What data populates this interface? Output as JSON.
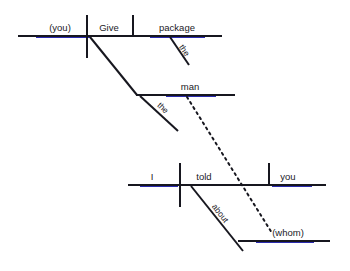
{
  "diagram": {
    "type": "sentence-diagram",
    "sentence": "(You) give the man the package (whom) I told you about.",
    "canvas": {
      "width": 350,
      "height": 271,
      "background": "#ffffff"
    },
    "colors": {
      "line": "#17171f",
      "text": "#1a1a26",
      "underline_tint": "#2b2bb0"
    },
    "clauses": [
      {
        "name": "main-clause",
        "baseline": {
          "x1": 18,
          "y1": 36,
          "x2": 222,
          "y2": 36
        },
        "words": [
          {
            "id": "subject",
            "text": "(you)",
            "x": 60,
            "y": 31,
            "anchor": "middle",
            "role": "subject",
            "implied": true
          },
          {
            "id": "verb",
            "text": "Give",
            "x": 109,
            "y": 31,
            "anchor": "middle",
            "role": "verb"
          },
          {
            "id": "direct-object",
            "text": "package",
            "x": 177,
            "y": 31,
            "anchor": "middle",
            "role": "direct-object"
          },
          {
            "id": "article-package",
            "text": "the",
            "x": 0,
            "y": 0,
            "anchor": "middle",
            "role": "article",
            "rotated": true
          }
        ],
        "dividers": [
          {
            "id": "subject-verb-divider",
            "x1": 87,
            "y1": 15,
            "x2": 87,
            "y2": 58
          },
          {
            "id": "verb-object-divider",
            "x1": 133,
            "y1": 15,
            "x2": 133,
            "y2": 36
          }
        ],
        "modifier_slants": [
          {
            "id": "the-package-slant",
            "x1": 170,
            "y1": 37,
            "x2": 189,
            "y2": 65,
            "label": "the"
          }
        ]
      },
      {
        "name": "indirect-object-branch",
        "baseline": {
          "x1": 137,
          "y1": 95,
          "x2": 235,
          "y2": 95
        },
        "words": [
          {
            "id": "indirect-object",
            "text": "man",
            "x": 190,
            "y": 90,
            "anchor": "middle",
            "role": "indirect-object"
          },
          {
            "id": "article-man",
            "text": "the",
            "x": 0,
            "y": 0,
            "anchor": "middle",
            "role": "article",
            "rotated": true
          }
        ],
        "connector_slant": {
          "id": "give-to-man-slant",
          "x1": 90,
          "y1": 37,
          "x2": 137,
          "y2": 95
        },
        "modifier_slants": [
          {
            "id": "the-man-slant",
            "x1": 140,
            "y1": 96,
            "x2": 178,
            "y2": 131,
            "label": "the"
          }
        ]
      },
      {
        "name": "relative-clause",
        "baseline": {
          "x1": 128,
          "y1": 185,
          "x2": 326,
          "y2": 185
        },
        "words": [
          {
            "id": "rel-subject",
            "text": "I",
            "x": 152,
            "y": 180,
            "anchor": "middle",
            "role": "subject"
          },
          {
            "id": "rel-verb",
            "text": "told",
            "x": 204,
            "y": 180,
            "anchor": "middle",
            "role": "verb"
          },
          {
            "id": "rel-object",
            "text": "you",
            "x": 288,
            "y": 180,
            "anchor": "middle",
            "role": "direct-object"
          }
        ],
        "dividers": [
          {
            "id": "rel-subject-verb-divider",
            "x1": 180,
            "y1": 163,
            "x2": 180,
            "y2": 207
          },
          {
            "id": "rel-verb-object-divider",
            "x1": 269,
            "y1": 163,
            "x2": 269,
            "y2": 185
          }
        ],
        "modifier_slants": [
          {
            "id": "about-slant",
            "x1": 191,
            "y1": 186,
            "x2": 243,
            "y2": 251,
            "label": "about"
          }
        ]
      },
      {
        "name": "prepositional-object",
        "baseline": {
          "x1": 240,
          "y1": 241,
          "x2": 330,
          "y2": 241
        },
        "words": [
          {
            "id": "prep-object",
            "text": "(whom)",
            "x": 288,
            "y": 236,
            "anchor": "middle",
            "role": "object-of-preposition",
            "implied": true
          }
        ]
      }
    ],
    "reference_line": {
      "id": "relative-pronoun-reference",
      "style": "dotted",
      "from": {
        "x": 187,
        "y": 97
      },
      "to": {
        "x": 272,
        "y": 233
      },
      "connects": [
        "man",
        "(whom)"
      ]
    },
    "rotated_labels": [
      {
        "id": "the-package-label",
        "text": "the",
        "x": 182,
        "y": 52,
        "rotation": 56
      },
      {
        "id": "the-man-label",
        "text": "the",
        "x": 161,
        "y": 110,
        "rotation": 43
      },
      {
        "id": "about-label",
        "text": "about",
        "x": 218,
        "y": 215,
        "rotation": 52
      }
    ]
  }
}
